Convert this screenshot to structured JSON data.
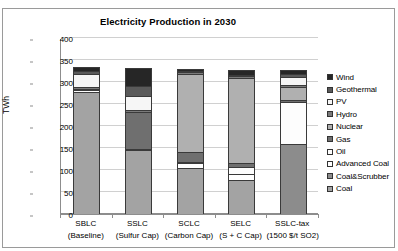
{
  "chart_data": {
    "type": "bar",
    "subtype": "stacked-column",
    "title": "Electricity Production in 2030",
    "xlabel": "",
    "ylabel": "TWh",
    "ylim": [
      0,
      400
    ],
    "ytick_step": 50,
    "yticks": [
      "0",
      "50",
      "100",
      "150",
      "200",
      "250",
      "300",
      "350",
      "400"
    ],
    "grid": true,
    "legend_position": "right",
    "categories": [
      {
        "line1": "SBLC",
        "line2": "(Baseline)"
      },
      {
        "line1": "SSLC",
        "line2": "(Sulfur Cap)"
      },
      {
        "line1": "SCLC",
        "line2": "(Carbon Cap)"
      },
      {
        "line1": "SELC",
        "line2": "(S + C Cap)"
      },
      {
        "line1": "SSLC-tax",
        "line2": "(1500 $/t SO2)"
      }
    ],
    "series": [
      {
        "name": "Coal",
        "color": "#a3a3a3",
        "values": [
          278,
          145,
          105,
          78,
          0
        ]
      },
      {
        "name": "Coal&Scrubber",
        "color": "#8c8c8c",
        "values": [
          0,
          0,
          0,
          0,
          160
        ]
      },
      {
        "name": "Advanced Coal",
        "color": "#ffffff",
        "values": [
          0,
          0,
          10,
          12,
          0
        ]
      },
      {
        "name": "Oil",
        "color": "#fdfdfd",
        "values": [
          3,
          3,
          3,
          16,
          95
        ]
      },
      {
        "name": "Gas",
        "color": "#6f6f6f",
        "values": [
          4,
          84,
          22,
          9,
          4
        ]
      },
      {
        "name": "Nuclear",
        "color": "#b0b0b0",
        "values": [
          0,
          0,
          178,
          195,
          30
        ]
      },
      {
        "name": "Hydro",
        "color": "#7a7a7a",
        "values": [
          4,
          4,
          4,
          4,
          4
        ]
      },
      {
        "name": "PV",
        "color": "#f6f6f6",
        "values": [
          30,
          33,
          0,
          0,
          18
        ]
      },
      {
        "name": "Geothermal",
        "color": "#5a5a5a",
        "values": [
          6,
          23,
          3,
          3,
          7
        ]
      },
      {
        "name": "Wind",
        "color": "#262626",
        "values": [
          10,
          41,
          5,
          11,
          10
        ]
      }
    ],
    "totals": [
      335,
      333,
      330,
      328,
      328
    ]
  },
  "legend": {
    "items": [
      {
        "label": "Wind",
        "color": "#262626"
      },
      {
        "label": "Geothermal",
        "color": "#5a5a5a"
      },
      {
        "label": "PV",
        "color": "#f6f6f6"
      },
      {
        "label": "Hydro",
        "color": "#7a7a7a"
      },
      {
        "label": "Nuclear",
        "color": "#b0b0b0"
      },
      {
        "label": "Gas",
        "color": "#6f6f6f"
      },
      {
        "label": "Oil",
        "color": "#fdfdfd"
      },
      {
        "label": "Advanced Coal",
        "color": "#ffffff"
      },
      {
        "label": "Coal&Scrubber",
        "color": "#8c8c8c"
      },
      {
        "label": "Coal",
        "color": "#a3a3a3"
      }
    ]
  }
}
